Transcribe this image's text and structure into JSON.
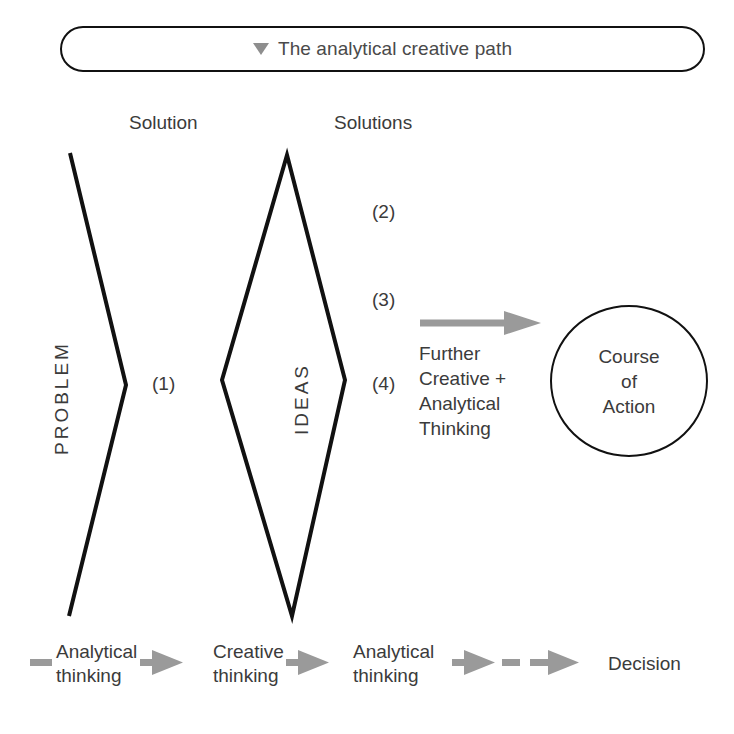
{
  "header": {
    "marker_icon": "triangle-down-icon",
    "title": "The analytical creative path"
  },
  "columns": {
    "solution": "Solution",
    "solutions": "Solutions"
  },
  "markers": {
    "one": "(1)",
    "two": "(2)",
    "three": "(3)",
    "four": "(4)"
  },
  "stages": {
    "problem": "PROBLEM",
    "ideas": "IDEAS",
    "further": "Further\nCreative +\nAnalytical\nThinking",
    "outcome_line1": "Course",
    "outcome_line2": "of",
    "outcome_line3": "Action"
  },
  "legend": {
    "step1": "Analytical\nthinking",
    "step2": "Creative\nthinking",
    "step3": "Analytical\nthinking",
    "step4": "Decision"
  },
  "colors": {
    "ink": "#111111",
    "text": "#3b3b3b",
    "muted": "#4a4a4a",
    "arrow_gray": "#9a9a9a",
    "background": "#ffffff"
  }
}
